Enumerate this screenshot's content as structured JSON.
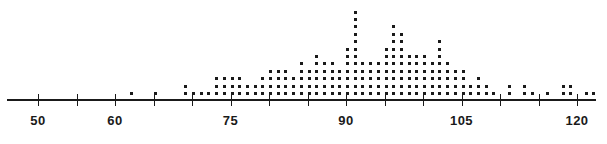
{
  "chart_data": {
    "type": "scatter",
    "plot_style": "dot-plot",
    "title": "",
    "subtitle": "",
    "xlabel": "",
    "ylabel": "",
    "legend": [],
    "grid": false,
    "axis": {
      "orientation": "horizontal",
      "xlim": [
        46,
        122.5
      ],
      "tick_values": [
        50,
        55,
        60,
        65,
        70,
        75,
        80,
        85,
        90,
        95,
        100,
        105,
        110,
        115,
        120
      ],
      "labeled_ticks": [
        50,
        60,
        75,
        90,
        105,
        120
      ],
      "tick_labels": [
        "50",
        "60",
        "75",
        "90",
        "105",
        "120"
      ],
      "minor_tick_interval": 5,
      "line_color": "#1a1a1a"
    },
    "dot_color": "#1a1a1a",
    "dot_size_px": 3,
    "dot_unit": 1,
    "total_count": 245,
    "x": [
      62,
      65,
      69,
      70,
      71,
      72,
      73,
      74,
      75,
      76,
      77,
      78,
      79,
      80,
      81,
      82,
      83,
      84,
      85,
      86,
      87,
      88,
      89,
      90,
      91,
      92,
      93,
      94,
      95,
      96,
      97,
      98,
      99,
      100,
      101,
      102,
      103,
      104,
      105,
      106,
      107,
      108,
      109,
      111,
      113,
      114,
      116,
      118,
      119,
      121,
      122
    ],
    "counts": [
      1,
      1,
      2,
      1,
      1,
      1,
      3,
      3,
      3,
      3,
      2,
      2,
      3,
      4,
      4,
      4,
      3,
      5,
      4,
      6,
      5,
      5,
      4,
      7,
      12,
      5,
      5,
      5,
      7,
      10,
      9,
      6,
      6,
      6,
      5,
      8,
      5,
      4,
      4,
      2,
      3,
      2,
      1,
      2,
      2,
      1,
      1,
      2,
      2,
      1,
      1
    ]
  }
}
